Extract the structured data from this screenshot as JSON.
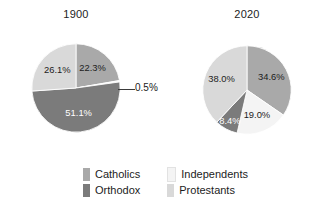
{
  "chart_data": [
    {
      "type": "pie",
      "title": "1900",
      "categories": [
        "Catholics",
        "Independents",
        "Orthodox",
        "Protestants"
      ],
      "values": [
        22.3,
        0.5,
        51.1,
        26.1
      ],
      "labels": [
        "22.3%",
        "0.5%",
        "51.1%",
        "26.1%"
      ],
      "start_angle_deg": 0,
      "direction": "clockwise",
      "legend_position": "bottom",
      "grid": false,
      "xlabel": "",
      "ylabel": ""
    },
    {
      "type": "pie",
      "title": "2020",
      "categories": [
        "Catholics",
        "Independents",
        "Orthodox",
        "Protestants"
      ],
      "values": [
        34.6,
        19.0,
        8.4,
        38.0
      ],
      "labels": [
        "34.6%",
        "19.0%",
        "8.4%",
        "38.0%"
      ],
      "start_angle_deg": 0,
      "direction": "clockwise",
      "legend_position": "bottom",
      "grid": false,
      "xlabel": "",
      "ylabel": ""
    }
  ],
  "titles": {
    "left": "1900",
    "right": "2020"
  },
  "colors": {
    "catholics": "#a9a9a9",
    "orthodox": "#7b7b7b",
    "independents": "#f4f4f4",
    "protestants": "#d9d9d9",
    "outline": "#ffffff",
    "text": "#1c1c1c",
    "background": "#ffffff"
  },
  "left_chart": {
    "title": "1900",
    "slices": [
      {
        "name": "Catholics",
        "label": "22.3%",
        "value": 22.3,
        "color": "#a9a9a9"
      },
      {
        "name": "Independents",
        "label": "0.5%",
        "value": 0.5,
        "color": "#f4f4f4"
      },
      {
        "name": "Orthodox",
        "label": "51.1%",
        "value": 51.1,
        "color": "#7b7b7b"
      },
      {
        "name": "Protestants",
        "label": "26.1%",
        "value": 26.1,
        "color": "#d9d9d9"
      }
    ],
    "callout": "0.5%"
  },
  "right_chart": {
    "title": "2020",
    "slices": [
      {
        "name": "Catholics",
        "label": "34.6%",
        "value": 34.6,
        "color": "#a9a9a9"
      },
      {
        "name": "Independents",
        "label": "19.0%",
        "value": 19.0,
        "color": "#f4f4f4"
      },
      {
        "name": "Orthodox",
        "label": "8.4%",
        "value": 8.4,
        "color": "#7b7b7b"
      },
      {
        "name": "Protestants",
        "label": "38.0%",
        "value": 38.0,
        "color": "#d9d9d9"
      }
    ]
  },
  "legend": {
    "items": [
      {
        "label": "Catholics",
        "color": "#a9a9a9"
      },
      {
        "label": "Independents",
        "color": "#f4f4f4"
      },
      {
        "label": "Orthodox",
        "color": "#7b7b7b"
      },
      {
        "label": "Protestants",
        "color": "#d9d9d9"
      }
    ]
  }
}
